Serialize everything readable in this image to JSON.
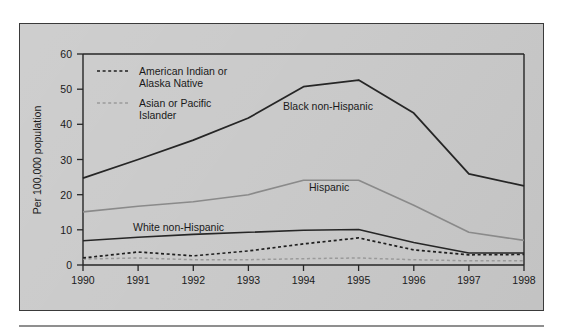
{
  "figure": {
    "background_color": "#c9c9c9",
    "border_color": "#3a3a3a",
    "plot_background_color": "#c9c9c9"
  },
  "chart_data": {
    "type": "line",
    "title": "",
    "subtitle": "",
    "xlabel": "",
    "ylabel": "Per 100,000 population",
    "x": [
      1990,
      1991,
      1992,
      1993,
      1994,
      1995,
      1996,
      1997,
      1998
    ],
    "categories": [
      "1990",
      "1991",
      "1992",
      "1993",
      "1994",
      "1995",
      "1996",
      "1997",
      "1998"
    ],
    "xlim": [
      1990,
      1998
    ],
    "ylim": [
      0,
      60
    ],
    "yticks": [
      0,
      10,
      20,
      30,
      40,
      50,
      60
    ],
    "ytick_labels": [
      "0",
      "10",
      "20",
      "30",
      "40",
      "50",
      "60"
    ],
    "grid": false,
    "legend_position": "upper-left-inside",
    "series": [
      {
        "name": "Black non-Hispanic",
        "label_type": "inline",
        "color": "#262626",
        "line_style": "solid",
        "line_width": 1.8,
        "values": [
          24.7,
          30.0,
          35.5,
          41.8,
          50.7,
          52.6,
          43.2,
          25.9,
          22.5
        ]
      },
      {
        "name": "Hispanic",
        "label_type": "inline",
        "color": "#8a8a8a",
        "line_style": "solid",
        "line_width": 1.6,
        "values": [
          15.1,
          16.7,
          18.0,
          20.0,
          24.1,
          24.1,
          17.0,
          9.3,
          7.0
        ]
      },
      {
        "name": "White non-Hispanic",
        "label_type": "inline",
        "color": "#262626",
        "line_style": "solid",
        "line_width": 1.6,
        "values": [
          6.9,
          7.9,
          8.7,
          9.3,
          9.9,
          10.1,
          6.4,
          3.4,
          3.4
        ]
      },
      {
        "name": "American Indian or Alaska Native",
        "label_type": "legend",
        "color": "#1f1f1f",
        "line_style": "dashed",
        "line_width": 1.7,
        "values": [
          2.0,
          3.7,
          2.6,
          4.0,
          6.0,
          7.7,
          4.3,
          2.9,
          3.0
        ]
      },
      {
        "name": "Asian or Pacific Islander",
        "label_type": "legend",
        "color": "#9a9a9a",
        "line_style": "dashed",
        "line_width": 1.5,
        "values": [
          1.7,
          2.0,
          1.5,
          1.5,
          1.8,
          2.0,
          1.5,
          1.2,
          1.2
        ]
      }
    ],
    "legend_entries": [
      {
        "label_line1": "American Indian or",
        "label_line2": "Alaska Native",
        "color": "#1f1f1f",
        "line_style": "dashed"
      },
      {
        "label_line1": "Asian or Pacific",
        "label_line2": "Islander",
        "color": "#9a9a9a",
        "line_style": "dashed"
      }
    ],
    "inline_annotations": [
      {
        "text": "Black non-Hispanic",
        "color": "#1a1a1a"
      },
      {
        "text": "Hispanic",
        "color": "#1a1a1a"
      },
      {
        "text": "White non-Hispanic",
        "color": "#1a1a1a"
      }
    ]
  }
}
